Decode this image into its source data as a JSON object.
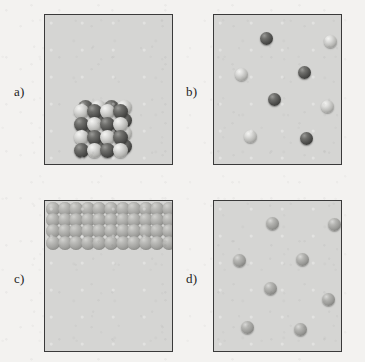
{
  "figure": {
    "background_color": "#f3f2f0",
    "panel_fill_color": "#d5d5d3",
    "panel_border_color": "#3a3a3a"
  },
  "panels": [
    {
      "id": "a",
      "label": "a)",
      "label_x": 14,
      "label_y": 84,
      "box": {
        "x": 44,
        "y": 14,
        "w": 129,
        "h": 151
      },
      "content_type": "crystalline-cluster",
      "description": "ordered binary lattice cluster resting on the bottom of the box",
      "cluster": {
        "origin_x": 36,
        "origin_y": 96,
        "sphere_diameter": 15,
        "step_x": 13,
        "step_y": 13,
        "columns": 4,
        "rows": 4,
        "offset_back_x": 4,
        "offset_back_y": -4,
        "pattern": [
          [
            "light",
            "dark",
            "light",
            "dark"
          ],
          [
            "dark",
            "light",
            "dark",
            "light"
          ],
          [
            "light",
            "dark",
            "light",
            "dark"
          ],
          [
            "dark",
            "light",
            "dark",
            "light"
          ]
        ]
      }
    },
    {
      "id": "b",
      "label": "b)",
      "label_x": 186,
      "label_y": 84,
      "box": {
        "x": 213,
        "y": 14,
        "w": 129,
        "h": 151
      },
      "content_type": "dispersed-two-species",
      "description": "eight separated particles of two alternating kinds",
      "particles": [
        {
          "cx": 52,
          "cy": 23,
          "d": 13,
          "shade": "dark"
        },
        {
          "cx": 116,
          "cy": 26,
          "d": 13,
          "shade": "light"
        },
        {
          "cx": 27,
          "cy": 59,
          "d": 13,
          "shade": "light"
        },
        {
          "cx": 90,
          "cy": 57,
          "d": 13,
          "shade": "dark"
        },
        {
          "cx": 60,
          "cy": 84,
          "d": 13,
          "shade": "dark"
        },
        {
          "cx": 113,
          "cy": 91,
          "d": 13,
          "shade": "light"
        },
        {
          "cx": 36,
          "cy": 121,
          "d": 13,
          "shade": "light"
        },
        {
          "cx": 92,
          "cy": 123,
          "d": 13,
          "shade": "dark"
        }
      ]
    },
    {
      "id": "c",
      "label": "c)",
      "label_x": 14,
      "label_y": 271,
      "box": {
        "x": 44,
        "y": 200,
        "w": 129,
        "h": 152
      },
      "content_type": "packed-layer",
      "description": "dense close-packed layer of identical particles filling the top of the box",
      "layer": {
        "origin_x": 1,
        "origin_y": 1,
        "sphere_diameter": 14,
        "step_x": 11.6,
        "step_y": 11.2,
        "columns": 12,
        "rows": 4,
        "row_offset_x": 0
      }
    },
    {
      "id": "d",
      "label": "d)",
      "label_x": 186,
      "label_y": 271,
      "box": {
        "x": 213,
        "y": 200,
        "w": 129,
        "h": 152
      },
      "content_type": "dispersed-one-species",
      "description": "eight separated identical particles",
      "particles": [
        {
          "cx": 58,
          "cy": 22,
          "d": 13,
          "shade": "mid"
        },
        {
          "cx": 120,
          "cy": 23,
          "d": 13,
          "shade": "mid"
        },
        {
          "cx": 25,
          "cy": 59,
          "d": 13,
          "shade": "mid"
        },
        {
          "cx": 88,
          "cy": 58,
          "d": 13,
          "shade": "mid"
        },
        {
          "cx": 56,
          "cy": 87,
          "d": 13,
          "shade": "mid"
        },
        {
          "cx": 114,
          "cy": 98,
          "d": 13,
          "shade": "mid"
        },
        {
          "cx": 33,
          "cy": 126,
          "d": 13,
          "shade": "mid"
        },
        {
          "cx": 86,
          "cy": 128,
          "d": 13,
          "shade": "mid"
        }
      ]
    }
  ]
}
